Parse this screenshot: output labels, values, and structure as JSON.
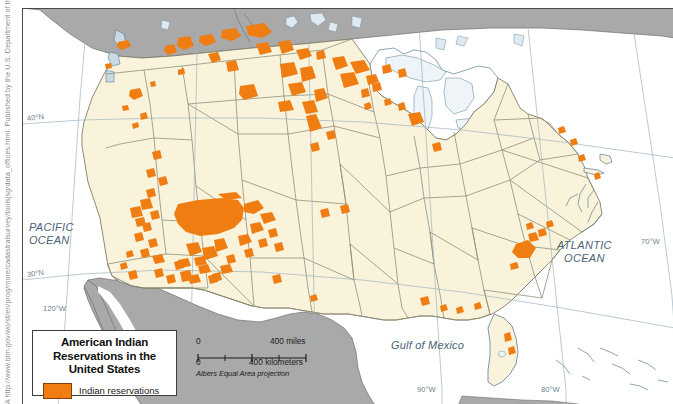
{
  "credit": {
    "text": "A http://www.blm.gov/wo/st/en/prog/more/cadastralsurvey/toolsjsg/data_offices.html. Published by the U.S. Department of the Interior, Bureau of Land Management."
  },
  "legend": {
    "title_line1": "American Indian",
    "title_line2": "Reservations in the",
    "title_line3": "United States",
    "swatch_label": "Indian reservations",
    "swatch_color": "#ef7d12",
    "swatch_border_color": "#8a3d0a"
  },
  "scalebar": {
    "miles_zero": "0",
    "miles_label": "400 miles",
    "km_zero": "0",
    "km_label": "400 kilometers",
    "projection": "Albers Equal Area projection"
  },
  "map": {
    "ocean_labels": [
      {
        "name": "pacific-ocean",
        "line1": "PACIFIC",
        "line2": "OCEAN"
      },
      {
        "name": "atlantic-ocean",
        "line1": "ATLANTIC",
        "line2": "OCEAN"
      }
    ],
    "gulf_label": "Gulf of Mexico",
    "graticule_labels": [
      {
        "name": "lat-40n",
        "text": "40°N"
      },
      {
        "name": "lat-30n",
        "text": "30°N"
      },
      {
        "name": "lon-120w",
        "text": "120°W"
      },
      {
        "name": "lon-90w",
        "text": "90°W"
      },
      {
        "name": "lon-80w",
        "text": "80°W"
      },
      {
        "name": "lon-70w",
        "text": "70°W"
      }
    ],
    "colors": {
      "us_land": "#faf3dc",
      "foreign_land": "#a9a9a9",
      "water": "#ffffff",
      "lake_fill": "#eef4f7",
      "reservation": "#ef7d12",
      "border": "#8f8f7a",
      "coastline": "#5d7f92",
      "frame": "#4a4a4a"
    }
  }
}
